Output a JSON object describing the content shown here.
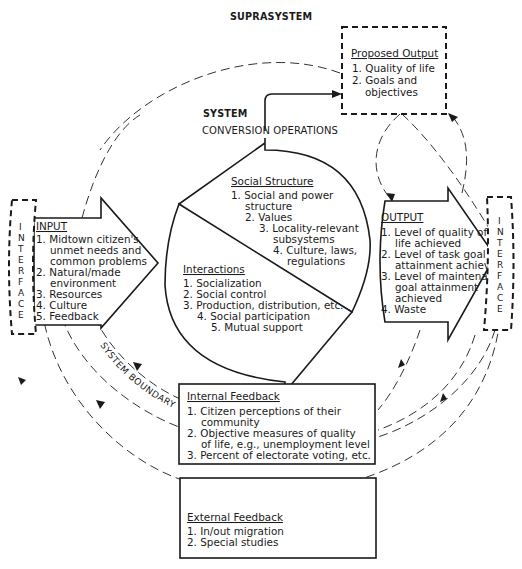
{
  "diagram": {
    "title": "SUPRASYSTEM",
    "system_label": "SYSTEM",
    "conversion_label": "CONVERSION OPERATIONS",
    "system_boundary_label": "SYSTEM BOUNDARY",
    "interface_left": [
      "I",
      "N",
      "T",
      "E",
      "R",
      "F",
      "A",
      "C",
      "E"
    ],
    "interface_right": [
      "I",
      "N",
      "T",
      "E",
      "R",
      "F",
      "A",
      "C",
      "E"
    ],
    "proposed_output": {
      "heading": "Proposed Output",
      "lines": [
        "1.  Quality of life",
        "2.  Goals and",
        "objectives"
      ]
    },
    "input": {
      "heading": "INPUT",
      "lines": [
        "1.  Midtown citizen's",
        "unmet needs and",
        "common problems",
        "2.  Natural/made",
        "environment",
        "3.  Resources",
        "4.  Culture",
        "5.  Feedback"
      ]
    },
    "social_structure": {
      "heading": "Social Structure",
      "lines": [
        "1.  Social and power",
        "structure",
        "2.  Values",
        "3.  Locality-relevant",
        "subsystems",
        "4.  Culture, laws,",
        "regulations"
      ]
    },
    "interactions": {
      "heading": "Interactions",
      "lines": [
        "1.  Socialization",
        "2.  Social control",
        "3.  Production, distribution, etc.",
        "4.  Social participation",
        "5.  Mutual support"
      ]
    },
    "output": {
      "heading": "OUTPUT",
      "lines": [
        "1.  Level of quality of",
        "life achieved",
        "2.  Level of task goal",
        "attainment achieved",
        "3.  Level of maintenance",
        "goal attainment",
        "achieved",
        "4.  Waste"
      ]
    },
    "internal_feedback": {
      "heading": "Internal Feedback",
      "lines": [
        "1.  Citizen perceptions of their",
        "community",
        "2.  Objective measures of quality",
        "of life, e.g., unemployment level",
        "3.  Percent of electorate voting, etc."
      ]
    },
    "external_feedback": {
      "heading": "External Feedback",
      "lines": [
        "1.  In/out migration",
        "2.  Special studies"
      ]
    }
  }
}
